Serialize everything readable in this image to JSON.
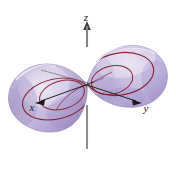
{
  "figure": {
    "background_color": "#ffffff",
    "width": 176,
    "height": 170
  },
  "axes": {
    "z": {
      "label": "z",
      "label_x": 86,
      "label_y": 21,
      "line_color": "#8a8a8a",
      "arrow_color": "#3a3a3a",
      "top_y": 24,
      "bottom_y": 149,
      "x": 87
    },
    "y": {
      "label": "y",
      "label_x": 146,
      "label_y": 112,
      "line_color": "#2a2a2a",
      "arrow_color": "#1a1a1a",
      "start_x": 87,
      "start_y": 85,
      "end_x": 141,
      "end_y": 103
    },
    "x": {
      "label": "x",
      "label_x": 32,
      "label_y": 110,
      "line_color": "#2a2a2a",
      "arrow_color": "#1a1a1a",
      "start_x": 87,
      "start_y": 85,
      "end_x": 38,
      "end_y": 102
    }
  },
  "surface": {
    "fill_light": "#d8d2e8",
    "fill_mid": "#b7a9d4",
    "fill_dark": "#9b8ac0",
    "fill_edge": "#8e7fb5",
    "highlight": "#e6e2f1",
    "outline_color": "#8b7aa8",
    "trace_color": "#8e2437",
    "trace_color_soft": "#a04050",
    "lobes": [
      {
        "name": "left-lobe",
        "position": "lower-left",
        "description": "Lower sheet of hyperboloid extending toward negative x"
      },
      {
        "name": "right-lobe",
        "position": "upper-right",
        "description": "Upper sheet of hyperboloid extending toward positive y"
      }
    ],
    "traces": [
      {
        "name": "left-outer-ellipse"
      },
      {
        "name": "left-inner-ellipse"
      },
      {
        "name": "right-outer-ellipse"
      },
      {
        "name": "right-inner-ellipse"
      }
    ]
  }
}
